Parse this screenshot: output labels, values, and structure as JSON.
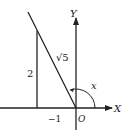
{
  "diagram": {
    "axis_x_label": "X",
    "axis_y_label": "Y",
    "origin_label": "O",
    "hypotenuse_label": "√5",
    "vertical_side_label": "2",
    "horizontal_side_label": "−1",
    "angle_label": "x",
    "color": "#222222"
  }
}
